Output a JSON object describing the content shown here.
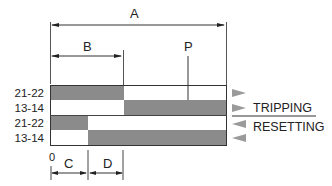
{
  "diagram": {
    "type": "relay-timing-diagram",
    "labels": {
      "A": "A",
      "B": "B",
      "P": "P",
      "C": "C",
      "D": "D",
      "origin": "0"
    },
    "rows": [
      {
        "label": "21-22",
        "group": "tripping",
        "state_before": "on",
        "state_after": "off"
      },
      {
        "label": "13-14",
        "group": "tripping",
        "state_before": "off",
        "state_after": "on"
      },
      {
        "label": "21-22",
        "group": "resetting",
        "state_before": "on",
        "state_after": "off"
      },
      {
        "label": "13-14",
        "group": "resetting",
        "state_before": "off",
        "state_after": "on"
      }
    ],
    "legend": {
      "tripping": "TRIPPING",
      "resetting": "RESETTING"
    },
    "colors": {
      "bar": "#8b8b8b",
      "marker": "#9a9a9a",
      "line": "#444444"
    }
  }
}
